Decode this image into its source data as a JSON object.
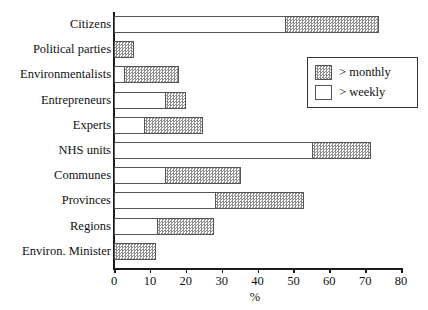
{
  "chart_data": {
    "type": "bar",
    "orientation": "horizontal",
    "stacked": true,
    "title": "",
    "xlabel": "%",
    "ylabel": "",
    "xlim": [
      0,
      80
    ],
    "xticks": [
      0,
      10,
      20,
      30,
      40,
      50,
      60,
      70,
      80
    ],
    "xtick_labels": [
      "0",
      "10",
      "20",
      "30",
      "40",
      "50",
      "60",
      "70",
      "80"
    ],
    "grid": false,
    "legend_position": "upper right",
    "categories": [
      "Citizens",
      "Political parties",
      "Environmentalists",
      "Entrepreneurs",
      "Experts",
      "NHS units",
      "Communes",
      "Provinces",
      "Regions",
      "Environ. Minister"
    ],
    "series": [
      {
        "name": "> weekly",
        "style": "white",
        "values": [
          47.4,
          0.0,
          2.6,
          14.0,
          8.2,
          55.0,
          13.8,
          28.0,
          11.6,
          0.0
        ]
      },
      {
        "name": "> monthly",
        "style": "hatched-gray",
        "values": [
          26.4,
          5.7,
          15.6,
          6.0,
          16.5,
          16.6,
          21.7,
          25.0,
          16.4,
          11.7
        ]
      }
    ],
    "totals": [
      73.8,
      5.7,
      18.2,
      20.0,
      24.7,
      71.6,
      35.5,
      53.0,
      28.0,
      11.7
    ]
  },
  "legend": {
    "entries": [
      {
        "label": "> monthly",
        "swatch": "hatched-gray"
      },
      {
        "label": "> weekly",
        "swatch": "white"
      }
    ]
  },
  "colors": {
    "hatch_gray": "#8f8f8f",
    "bar_outline": "#555555",
    "axis": "#1a1a1a",
    "background": "#ffffff",
    "text": "#111111"
  }
}
